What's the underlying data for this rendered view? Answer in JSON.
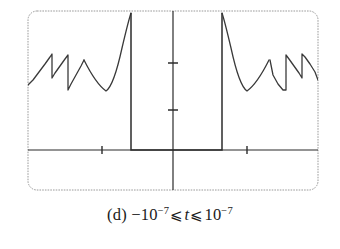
{
  "figure": {
    "caption": {
      "label": "(d)",
      "lower_sign": "−",
      "lower_base": "10",
      "lower_exponent": "−7",
      "left_relation": "⩽",
      "variable": "t",
      "right_relation": "⩽",
      "upper_base": "10",
      "upper_exponent": "−7",
      "full_text": "(d) −10⁻⁷ ⩽ t ⩽ 10⁻⁷"
    },
    "colors": {
      "frame": "#9a9a9a",
      "axis": "#2b2b2b",
      "curve": "#3a3a3a",
      "background": "#ffffff",
      "caption_text": "#1a1a1a"
    }
  },
  "chart_data": {
    "type": "line",
    "title": "",
    "subtitle": "",
    "xlabel": "t",
    "ylabel": "",
    "xlim": [
      -1e-07,
      1e-07
    ],
    "ylim": [
      -0.45,
      1.55
    ],
    "grid": false,
    "legend": null,
    "annotations": [],
    "axes": {
      "x_axis_y_value": 0,
      "y_axis_x_value": 0,
      "x_ticks": [
        -5e-08,
        5e-08
      ],
      "x_tick_labels": [
        "",
        ""
      ],
      "y_ticks": [
        0.5,
        1.0
      ],
      "y_tick_labels": [
        "",
        ""
      ],
      "tick_marks_only": true
    },
    "frame": {
      "x_px": 28,
      "y_px": 11,
      "width_px": 290,
      "height_px": 179,
      "corner_radius_px": 9
    },
    "pixel_geometry": {
      "axis_y_px": 150,
      "axis_x_px": 173,
      "x_tick_px": [
        102,
        247
      ],
      "y_tick_px": [
        63,
        110
      ],
      "box_left_px": 131,
      "box_right_px": 222,
      "top_clip_px": 13
    },
    "series": [
      {
        "name": "left-sawtooth",
        "kind": "polyline",
        "points_px": [
          [
            28,
            85
          ],
          [
            33,
            80
          ],
          [
            39,
            72
          ],
          [
            45,
            64
          ],
          [
            50,
            57
          ],
          [
            52,
            54
          ],
          [
            52,
            78
          ],
          [
            55,
            73
          ],
          [
            60,
            66
          ],
          [
            65,
            59
          ],
          [
            68,
            55
          ],
          [
            68,
            90
          ],
          [
            71,
            84
          ],
          [
            76,
            75
          ],
          [
            81,
            66
          ],
          [
            84,
            60
          ]
        ]
      },
      {
        "name": "left-asymptote",
        "kind": "curve",
        "points_px": [
          [
            84,
            60
          ],
          [
            90,
            72
          ],
          [
            96,
            82
          ],
          [
            101,
            88
          ],
          [
            106,
            91
          ],
          [
            110,
            86
          ],
          [
            114,
            76
          ],
          [
            118,
            63
          ],
          [
            122,
            48
          ],
          [
            126,
            32
          ],
          [
            129,
            20
          ],
          [
            131,
            13
          ]
        ]
      },
      {
        "name": "plateau-box",
        "kind": "polyline",
        "points_px": [
          [
            131,
            13
          ],
          [
            131,
            150
          ],
          [
            222,
            150
          ],
          [
            222,
            13
          ]
        ]
      },
      {
        "name": "right-asymptote",
        "kind": "curve",
        "points_px": [
          [
            222,
            13
          ],
          [
            225,
            20
          ],
          [
            228,
            32
          ],
          [
            232,
            48
          ],
          [
            236,
            63
          ],
          [
            240,
            76
          ],
          [
            244,
            86
          ],
          [
            248,
            91
          ],
          [
            253,
            88
          ],
          [
            258,
            82
          ],
          [
            264,
            72
          ],
          [
            270,
            60
          ]
        ]
      },
      {
        "name": "right-sawtooth",
        "kind": "polyline",
        "points_px": [
          [
            270,
            60
          ],
          [
            273,
            75
          ],
          [
            278,
            84
          ],
          [
            283,
            90
          ],
          [
            286,
            90
          ],
          [
            286,
            55
          ],
          [
            289,
            59
          ],
          [
            294,
            66
          ],
          [
            299,
            73
          ],
          [
            302,
            78
          ],
          [
            302,
            54
          ],
          [
            305,
            57
          ],
          [
            310,
            64
          ],
          [
            315,
            72
          ],
          [
            318,
            80
          ]
        ]
      }
    ]
  }
}
